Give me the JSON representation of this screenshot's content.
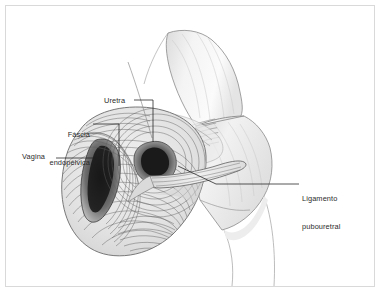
{
  "figure": {
    "domain": "anatomical-illustration",
    "background_color": "#ffffff",
    "frame_color": "#d9d9d9",
    "ink_color": "#4a4a4a",
    "text_color": "#2b2b2b",
    "bone_fill": "#f2f2f2",
    "tissue_fill": "#e8e8e8",
    "lumen_dark": "#3a3a3a"
  },
  "labels": {
    "uretra": "Uretra",
    "fascia_line1": "Fáscia",
    "fascia_line2": "endopélvica",
    "vagina": "Vagina",
    "ligamento_line1": "Ligamento",
    "ligamento_line2": "pubouretral"
  },
  "structures": [
    {
      "name": "urethra",
      "label": "Uretra"
    },
    {
      "name": "endopelvic-fascia",
      "label": "Fáscia endopélvica"
    },
    {
      "name": "vagina",
      "label": "Vagina"
    },
    {
      "name": "pubourethral-ligament",
      "label": "Ligamento pubouretral"
    },
    {
      "name": "pubic-bone",
      "label": ""
    }
  ]
}
